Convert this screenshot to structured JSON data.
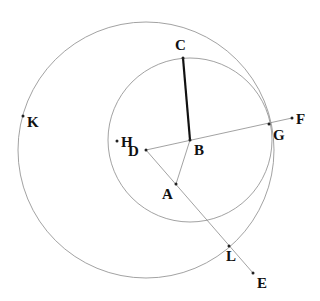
{
  "diagram": {
    "title": "",
    "circles": [
      {
        "name": "large-circle",
        "center": "D",
        "cx": 146,
        "cy": 150,
        "r": 128
      },
      {
        "name": "small-circle",
        "center": "B",
        "cx": 190,
        "cy": 140,
        "r": 82
      }
    ],
    "points": {
      "A": {
        "label": "A",
        "x": 176,
        "y": 184,
        "lx": 162,
        "ly": 199
      },
      "B": {
        "label": "B",
        "x": 190,
        "y": 140,
        "lx": 194,
        "ly": 155
      },
      "C": {
        "label": "C",
        "x": 183,
        "y": 58,
        "lx": 175,
        "ly": 50
      },
      "D": {
        "label": "D",
        "x": 146,
        "y": 150,
        "lx": 128,
        "ly": 156
      },
      "E": {
        "label": "E",
        "x": 253,
        "y": 273,
        "lx": 257,
        "ly": 288
      },
      "F": {
        "label": "F",
        "x": 292,
        "y": 118,
        "lx": 296,
        "ly": 124
      },
      "G": {
        "label": "G",
        "x": 269,
        "y": 124,
        "lx": 273,
        "ly": 140
      },
      "H": {
        "label": "H",
        "x": 117,
        "y": 141,
        "lx": 121,
        "ly": 147
      },
      "K": {
        "label": "K",
        "x": 23,
        "y": 116,
        "lx": 27,
        "ly": 127
      },
      "L": {
        "label": "L",
        "x": 229,
        "y": 246,
        "lx": 226,
        "ly": 261
      }
    },
    "segments": [
      {
        "name": "segment-CB",
        "from": "C",
        "to": "B",
        "style": "thick"
      },
      {
        "name": "segment-DF",
        "from": "D",
        "to": "F",
        "style": "thin"
      },
      {
        "name": "segment-DE",
        "from": "D",
        "to": "E",
        "style": "thin"
      },
      {
        "name": "segment-BA",
        "from": "B",
        "to": "A",
        "style": "thin"
      }
    ]
  }
}
